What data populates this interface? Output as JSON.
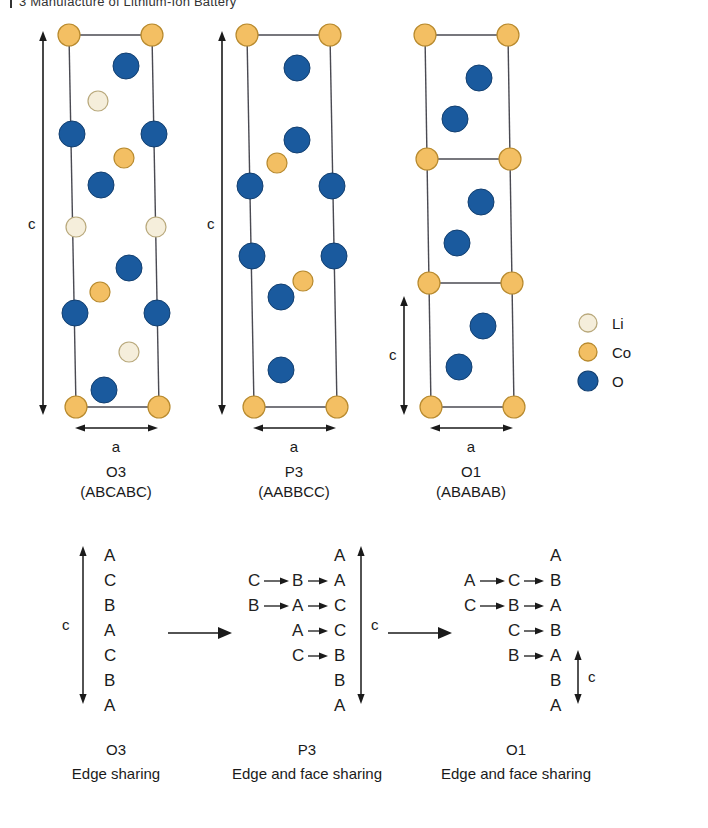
{
  "page": {
    "header": "3  Manufacture of Lithium-Ion Battery",
    "background": "#ffffff"
  },
  "legend": {
    "items": [
      {
        "name": "Li",
        "color": "#f5eedb",
        "stroke": "#b9a97c"
      },
      {
        "name": "Co",
        "color": "#f3bf63",
        "stroke": "#b88a2e"
      },
      {
        "name": "O",
        "color": "#1a5a9e",
        "stroke": "#123f70"
      }
    ]
  },
  "structures": [
    {
      "id": "O3",
      "name": "O3",
      "stacking": "(ABCABC)",
      "axis_c": "c",
      "axis_a": "a",
      "cells": 1,
      "atoms": {
        "Co_corners": 4,
        "Co_interior": 2,
        "Li": 4,
        "O": 8
      }
    },
    {
      "id": "P3",
      "name": "P3",
      "stacking": "(AABBCC)",
      "axis_c": "c",
      "axis_a": "a",
      "cells": 1,
      "atoms": {
        "Co_corners": 4,
        "Co_interior": 2,
        "Li": 0,
        "O": 8
      }
    },
    {
      "id": "O1",
      "name": "O1",
      "stacking": "(ABABAB)",
      "axis_c": "c",
      "axis_a": "a",
      "cells": 3,
      "atoms": {
        "Co_corners": 8,
        "Co_interior": 0,
        "Li": 0,
        "O": 6
      }
    }
  ],
  "sequence_diagram": {
    "arrows": [
      "→",
      "→"
    ],
    "columns": [
      {
        "id": "O3",
        "title": "O3",
        "subtitle": "Edge sharing",
        "color": "#3f8a57",
        "axis_c": "c",
        "axis_label_side": "left",
        "layers": [
          {
            "result": "A",
            "chain": []
          },
          {
            "result": "C",
            "chain": []
          },
          {
            "result": "B",
            "chain": []
          },
          {
            "result": "A",
            "chain": []
          },
          {
            "result": "C",
            "chain": []
          },
          {
            "result": "B",
            "chain": []
          },
          {
            "result": "A",
            "chain": []
          }
        ]
      },
      {
        "id": "P3",
        "title": "P3",
        "subtitle": "Edge and face sharing",
        "color": "#e8573f",
        "axis_c": "c",
        "axis_label_side": "right",
        "layers": [
          {
            "result": "A",
            "chain": []
          },
          {
            "result": "A",
            "chain": [
              "C",
              "B"
            ]
          },
          {
            "result": "C",
            "chain": [
              "B",
              "A"
            ]
          },
          {
            "result": "C",
            "chain": [
              "A"
            ]
          },
          {
            "result": "B",
            "chain": [
              "C"
            ]
          },
          {
            "result": "B",
            "chain": []
          },
          {
            "result": "A",
            "chain": []
          }
        ]
      },
      {
        "id": "O1",
        "title": "O1",
        "subtitle": "Edge and face sharing",
        "color": "#5b8fc9",
        "axis_c": "c",
        "axis_label_side": "right",
        "layers": [
          {
            "result": "A",
            "chain": []
          },
          {
            "result": "B",
            "chain": [
              "A",
              "C"
            ]
          },
          {
            "result": "A",
            "chain": [
              "C",
              "B"
            ]
          },
          {
            "result": "B",
            "chain": [
              "C"
            ]
          },
          {
            "result": "A",
            "chain": [
              "B"
            ]
          },
          {
            "result": "B",
            "chain": []
          },
          {
            "result": "A",
            "chain": []
          }
        ]
      }
    ]
  }
}
